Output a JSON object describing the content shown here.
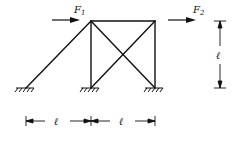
{
  "diagram": {
    "type": "truss-frame",
    "loads": [
      {
        "name": "F",
        "subscript": "1",
        "direction": "right"
      },
      {
        "name": "F",
        "subscript": "2",
        "direction": "right"
      }
    ],
    "dimensions": {
      "height": "ℓ",
      "span_left": "ℓ",
      "span_right": "ℓ"
    },
    "supports": [
      "fixed",
      "fixed",
      "fixed"
    ],
    "colors": {
      "line": "#111111",
      "background": "#ffffff"
    }
  }
}
